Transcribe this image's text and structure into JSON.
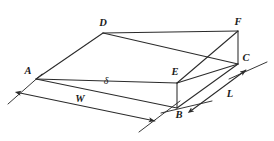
{
  "figure": {
    "type": "3d-wedge-geometry-diagram",
    "stroke_color": "#2b2b2b",
    "background_color": "#ffffff",
    "vertex_labels": [
      {
        "id": "A",
        "text": "A",
        "x": 28,
        "y": 71
      },
      {
        "id": "B",
        "text": "B",
        "x": 179,
        "y": 115
      },
      {
        "id": "C",
        "text": "C",
        "x": 246,
        "y": 58
      },
      {
        "id": "D",
        "text": "D",
        "x": 103,
        "y": 23
      },
      {
        "id": "E",
        "text": "E",
        "x": 175,
        "y": 72
      },
      {
        "id": "F",
        "text": "F",
        "x": 238,
        "y": 22
      }
    ],
    "dimension_labels": [
      {
        "id": "W",
        "text": "W",
        "x": 80,
        "y": 99,
        "greek": false
      },
      {
        "id": "L",
        "text": "L",
        "x": 230,
        "y": 94,
        "greek": false
      },
      {
        "id": "delta",
        "text": "δ",
        "x": 106,
        "y": 81,
        "greek": true
      }
    ],
    "vertices": {
      "A": {
        "x": 36,
        "y": 79
      },
      "B": {
        "x": 177,
        "y": 108
      },
      "C": {
        "x": 238,
        "y": 64
      },
      "D": {
        "x": 103,
        "y": 33
      },
      "E": {
        "x": 177,
        "y": 83
      },
      "F": {
        "x": 238,
        "y": 31
      }
    },
    "edges": [
      {
        "name": "edge-A-D",
        "from": "A",
        "to": "D"
      },
      {
        "name": "edge-D-F",
        "from": "D",
        "to": "F"
      },
      {
        "name": "edge-F-C",
        "from": "F",
        "to": "C"
      },
      {
        "name": "edge-A-E",
        "from": "A",
        "to": "E"
      },
      {
        "name": "edge-E-C",
        "from": "E",
        "to": "C"
      },
      {
        "name": "edge-A-B",
        "from": "A",
        "to": "B"
      },
      {
        "name": "edge-B-C",
        "from": "B",
        "to": "C"
      },
      {
        "name": "edge-E-B",
        "from": "E",
        "to": "B"
      },
      {
        "name": "edge-D-E",
        "from": "D",
        "to": "E"
      },
      {
        "name": "edge-D-C",
        "from": "D",
        "to": "C"
      },
      {
        "name": "edge-E-F",
        "from": "E",
        "to": "F"
      }
    ],
    "dimension_lines": [
      {
        "name": "width-dimension-line",
        "label": "W",
        "start": {
          "x": 20,
          "y": 93
        },
        "end": {
          "x": 155,
          "y": 121
        },
        "arrow_start": true,
        "arrow_end": true
      },
      {
        "name": "length-dimension-line",
        "label": "L",
        "start": {
          "x": 192,
          "y": 110
        },
        "end": {
          "x": 246,
          "y": 70
        },
        "arrow_start": true,
        "arrow_end": true
      }
    ],
    "extension_lines": [
      {
        "name": "extension-line-A",
        "x1": 8,
        "y1": 104,
        "x2": 42,
        "y2": 74
      },
      {
        "name": "extension-line-B-left",
        "x1": 139,
        "y1": 132,
        "x2": 180,
        "y2": 101
      },
      {
        "name": "extension-line-B-right",
        "x1": 161,
        "y1": 113,
        "x2": 212,
        "y2": 101
      },
      {
        "name": "extension-line-C",
        "x1": 229,
        "y1": 79,
        "x2": 267,
        "y2": 62
      }
    ]
  }
}
